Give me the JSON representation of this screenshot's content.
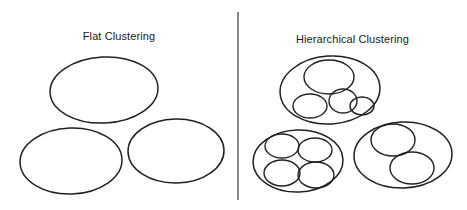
{
  "figure": {
    "canvas": {
      "width": 467,
      "height": 210,
      "background": "#ffffff"
    },
    "stroke_color": "#231f20",
    "divider": {
      "x": 238,
      "y1": 12,
      "y2": 200,
      "color": "#6d6e71"
    }
  },
  "panels": {
    "left": {
      "title": "Flat Clustering",
      "title_y": 37
    },
    "right": {
      "title": "Hierarchical Clustering",
      "title_y": 40
    }
  },
  "chart_data": {
    "type": "diagram",
    "panels": [
      {
        "name": "flat-clustering",
        "label": "Flat Clustering",
        "cluster_count": 3,
        "nesting_levels": 1,
        "clusters": [
          {
            "id": "flat-cluster-1",
            "cx": 104,
            "cy": 90,
            "rx": 54,
            "ry": 33,
            "rotation": -3,
            "children": []
          },
          {
            "id": "flat-cluster-2",
            "cx": 71,
            "cy": 161,
            "rx": 51,
            "ry": 33,
            "rotation": -2,
            "children": []
          },
          {
            "id": "flat-cluster-3",
            "cx": 176,
            "cy": 151,
            "rx": 48,
            "ry": 32,
            "rotation": -1,
            "children": []
          }
        ]
      },
      {
        "name": "hierarchical-clustering",
        "label": "Hierarchical Clustering",
        "cluster_count": 3,
        "nesting_levels": 2,
        "clusters": [
          {
            "id": "hier-cluster-1",
            "cx": 330,
            "cy": 90,
            "rx": 50,
            "ry": 34,
            "rotation": -4,
            "children": [
              {
                "id": "hier-1-child-1",
                "cx": 329,
                "cy": 77,
                "rx": 25,
                "ry": 17,
                "rotation": 0
              },
              {
                "id": "hier-1-child-2",
                "cx": 310,
                "cy": 106,
                "rx": 17,
                "ry": 12,
                "rotation": 0
              },
              {
                "id": "hier-1-child-3",
                "cx": 343,
                "cy": 101,
                "rx": 14,
                "ry": 12,
                "rotation": 0
              },
              {
                "id": "hier-1-child-4",
                "cx": 362,
                "cy": 106,
                "rx": 12,
                "ry": 9,
                "rotation": 0
              }
            ]
          },
          {
            "id": "hier-cluster-2",
            "cx": 298,
            "cy": 161,
            "rx": 45,
            "ry": 31,
            "rotation": -2,
            "children": [
              {
                "id": "hier-2-child-1",
                "cx": 282,
                "cy": 146,
                "rx": 17,
                "ry": 12,
                "rotation": 0
              },
              {
                "id": "hier-2-child-2",
                "cx": 315,
                "cy": 150,
                "rx": 17,
                "ry": 12,
                "rotation": 0
              },
              {
                "id": "hier-2-child-3",
                "cx": 282,
                "cy": 173,
                "rx": 18,
                "ry": 13,
                "rotation": 0
              },
              {
                "id": "hier-2-child-4",
                "cx": 316,
                "cy": 175,
                "rx": 18,
                "ry": 13,
                "rotation": 0
              }
            ]
          },
          {
            "id": "hier-cluster-3",
            "cx": 403,
            "cy": 155,
            "rx": 49,
            "ry": 33,
            "rotation": -2,
            "children": [
              {
                "id": "hier-3-child-1",
                "cx": 393,
                "cy": 140,
                "rx": 22,
                "ry": 16,
                "rotation": 0
              },
              {
                "id": "hier-3-child-2",
                "cx": 412,
                "cy": 168,
                "rx": 22,
                "ry": 16,
                "rotation": 0
              }
            ]
          }
        ]
      }
    ]
  }
}
